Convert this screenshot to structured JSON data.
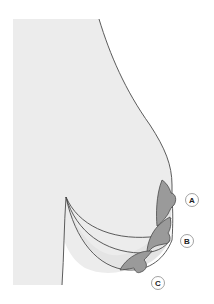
{
  "diagram": {
    "colors": {
      "background": "#ffffff",
      "body_fill": "#ececec",
      "outline": "#4a4a4a",
      "areola_fill": "#9a9a9a",
      "inner_fill": "#e4e4e4"
    },
    "labels": {
      "a": "A",
      "b": "B",
      "c": "C"
    },
    "grades": [
      {
        "id": "A",
        "description": "upper contour / nipple position A"
      },
      {
        "id": "B",
        "description": "middle contour / nipple position B"
      },
      {
        "id": "C",
        "description": "lowest contour / nipple position C"
      }
    ]
  }
}
